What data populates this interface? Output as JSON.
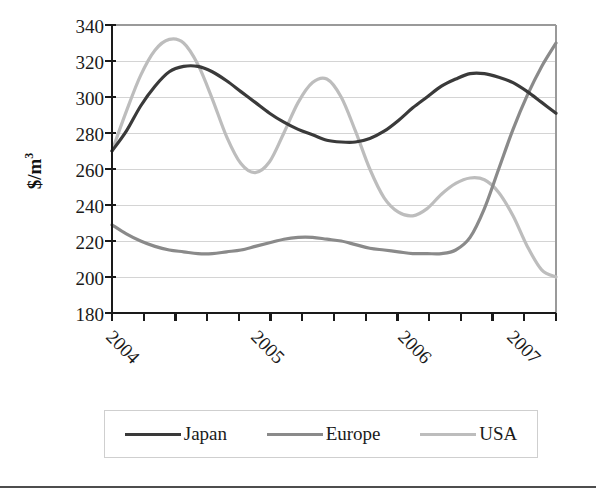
{
  "chart_data": {
    "type": "line",
    "title": "",
    "xlabel": "",
    "ylabel": "$/m3",
    "ylabel_display": "$/m",
    "ylabel_sup": "3",
    "ylim": [
      180,
      340
    ],
    "ytick_step": 20,
    "yticks": [
      340,
      320,
      300,
      280,
      260,
      240,
      220,
      200,
      180
    ],
    "xticks_labeled": [
      "2004",
      "2005",
      "2006",
      "2007"
    ],
    "xlim_label_start": "2004",
    "xlim_label_end": "2007",
    "x_minor_ticks_total": 14,
    "grid": "horizontal",
    "legend_position": "bottom",
    "x": [
      2003.9,
      2004.0,
      2004.1,
      2004.2,
      2004.3,
      2004.4,
      2004.5,
      2004.6,
      2004.7,
      2004.8,
      2004.9,
      2005.0,
      2005.1,
      2005.2,
      2005.3,
      2005.4,
      2005.5,
      2005.6,
      2005.7,
      2005.8,
      2005.9,
      2006.0,
      2006.1,
      2006.2,
      2006.3,
      2006.4,
      2006.5,
      2006.6,
      2006.7,
      2006.8,
      2006.9,
      2007.0
    ],
    "series": [
      {
        "name": "Japan",
        "color": "#3a3a3a",
        "width": 3.2,
        "values": [
          270,
          281,
          295,
          306,
          314,
          317,
          317,
          314,
          309,
          303,
          297,
          291,
          286,
          282,
          279,
          276,
          275,
          275,
          277,
          281,
          287,
          294,
          300,
          306,
          310,
          313,
          313,
          311,
          308,
          303,
          297,
          291
        ]
      },
      {
        "name": "Europe",
        "color": "#8a8a8a",
        "width": 3.2,
        "values": [
          229,
          224,
          220,
          217,
          215,
          214,
          213,
          213,
          214,
          215,
          217,
          219,
          221,
          222,
          222,
          221,
          220,
          218,
          216,
          215,
          214,
          213,
          213,
          213,
          215,
          222,
          238,
          260,
          282,
          301,
          317,
          330
        ]
      },
      {
        "name": "USA",
        "color": "#bdbdbd",
        "width": 3.2,
        "values": [
          270,
          292,
          312,
          326,
          332,
          330,
          318,
          299,
          278,
          263,
          258,
          264,
          280,
          297,
          308,
          310,
          300,
          281,
          260,
          244,
          236,
          234,
          238,
          246,
          252,
          255,
          254,
          247,
          234,
          217,
          204,
          200
        ]
      }
    ]
  },
  "axis": {
    "y_tick_labels": [
      "340",
      "320",
      "300",
      "280",
      "260",
      "240",
      "220",
      "200",
      "180"
    ],
    "y_title_main": "$/m",
    "y_title_sup": "3",
    "x_tick_labels": [
      "2004",
      "2005",
      "2006",
      "2007"
    ]
  },
  "legend": {
    "items": [
      {
        "label": "Japan",
        "color": "#3a3a3a",
        "width": "3px"
      },
      {
        "label": "Europe",
        "color": "#8a8a8a",
        "width": "3px"
      },
      {
        "label": "USA",
        "color": "#bdbdbd",
        "width": "3px"
      }
    ]
  },
  "colors": {
    "japan": "#3a3a3a",
    "europe": "#8a8a8a",
    "usa": "#bdbdbd",
    "axis": "#1a1a1a",
    "grid": "#d4d4d4",
    "plot_border": "#9a9a9a",
    "legend_border": "#cfcfcf",
    "bottom_rule": "#4d4d4d"
  }
}
